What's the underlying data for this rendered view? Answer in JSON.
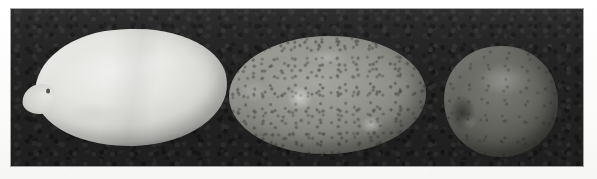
{
  "figure": {
    "kind": "grayscale-photograph",
    "caption": "",
    "background_color": "#232323",
    "page_color": "#ffffff",
    "panel": {
      "left": 11,
      "top": 9,
      "width": 572,
      "height": 157
    },
    "specimen_count": "3"
  },
  "specimens": [
    {
      "id": "specimen-1",
      "position": "left",
      "shape": "elongated oval with tapered left end",
      "relative_size": "large",
      "tone": "pale / very light gray",
      "fill_color": "#e4e4e1",
      "surface": "smooth, bright, faint crease across the middle",
      "marking": "small dark eye near the tapered tip",
      "bbox": {
        "x": 46,
        "y": 40,
        "width": 170,
        "height": 95
      }
    },
    {
      "id": "specimen-2",
      "position": "center",
      "shape": "broad ellipse",
      "relative_size": "medium",
      "tone": "medium gray",
      "fill_color": "#96968f",
      "surface": "russeted, densely speckled with dark lenticels and pale highlight patches",
      "marking": "two bright highlight patches on the lower-left and lower-right flanks",
      "bbox": {
        "x": 240,
        "y": 47,
        "width": 175,
        "height": 96
      }
    },
    {
      "id": "specimen-3",
      "position": "right",
      "shape": "nearly round",
      "relative_size": "small",
      "tone": "dark gray",
      "fill_color": "#63635e",
      "surface": "matte with faint mottling",
      "marking": "shallow scar / depression on the left flank",
      "bbox": {
        "x": 455,
        "y": 57,
        "width": 92,
        "height": 89
      }
    }
  ]
}
